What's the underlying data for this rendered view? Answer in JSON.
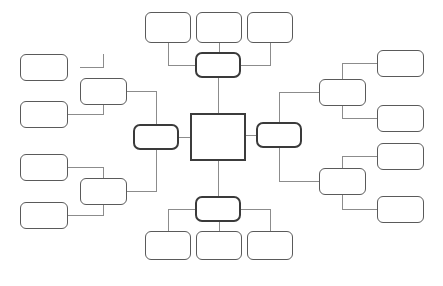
{
  "diagram": {
    "type": "concept-map",
    "title": "",
    "orientation": "radial",
    "style": {
      "background_color": "#ffffff",
      "node_fill": "#ffffff",
      "node_border_color": "#5a5a5a",
      "hub_border_color": "#3a3a3a",
      "center_border_color": "#3c3c3c",
      "connector_color": "#8c8c8c",
      "connector_width": 1
    },
    "center": {
      "id": "center",
      "label": "",
      "shape": "square",
      "x": 190,
      "y": 113,
      "w": 56,
      "h": 48
    },
    "hubs": [
      {
        "id": "hub-top",
        "label": "",
        "x": 195,
        "y": 52,
        "w": 46,
        "h": 26
      },
      {
        "id": "hub-bottom",
        "label": "",
        "x": 195,
        "y": 196,
        "w": 46,
        "h": 26
      },
      {
        "id": "hub-left",
        "label": "",
        "x": 133,
        "y": 124,
        "w": 46,
        "h": 26
      },
      {
        "id": "hub-right",
        "label": "",
        "x": 256,
        "y": 122,
        "w": 46,
        "h": 26
      }
    ],
    "branches": [
      {
        "id": "branch-left-upper",
        "label": "",
        "x": 80,
        "y": 78,
        "w": 47,
        "h": 27
      },
      {
        "id": "branch-left-lower",
        "label": "",
        "x": 80,
        "y": 178,
        "w": 47,
        "h": 27
      },
      {
        "id": "branch-right-upper",
        "label": "",
        "x": 319,
        "y": 79,
        "w": 47,
        "h": 27
      },
      {
        "id": "branch-right-lower",
        "label": "",
        "x": 319,
        "y": 168,
        "w": 47,
        "h": 27
      }
    ],
    "leaves": [
      {
        "id": "leaf-top-1",
        "label": "",
        "x": 145,
        "y": 12,
        "w": 46,
        "h": 31
      },
      {
        "id": "leaf-top-2",
        "label": "",
        "x": 196,
        "y": 12,
        "w": 46,
        "h": 31
      },
      {
        "id": "leaf-top-3",
        "label": "",
        "x": 247,
        "y": 12,
        "w": 46,
        "h": 31
      },
      {
        "id": "leaf-bottom-1",
        "label": "",
        "x": 145,
        "y": 231,
        "w": 46,
        "h": 29
      },
      {
        "id": "leaf-bottom-2",
        "label": "",
        "x": 196,
        "y": 231,
        "w": 46,
        "h": 29
      },
      {
        "id": "leaf-bottom-3",
        "label": "",
        "x": 247,
        "y": 231,
        "w": 46,
        "h": 29
      },
      {
        "id": "leaf-left-upper-1",
        "label": "",
        "x": 20,
        "y": 54,
        "w": 48,
        "h": 27
      },
      {
        "id": "leaf-left-upper-2",
        "label": "",
        "x": 20,
        "y": 101,
        "w": 48,
        "h": 27
      },
      {
        "id": "leaf-left-lower-1",
        "label": "",
        "x": 20,
        "y": 154,
        "w": 48,
        "h": 27
      },
      {
        "id": "leaf-left-lower-2",
        "label": "",
        "x": 20,
        "y": 202,
        "w": 48,
        "h": 27
      },
      {
        "id": "leaf-right-upper-1",
        "label": "",
        "x": 377,
        "y": 50,
        "w": 47,
        "h": 27
      },
      {
        "id": "leaf-right-upper-2",
        "label": "",
        "x": 377,
        "y": 105,
        "w": 47,
        "h": 27
      },
      {
        "id": "leaf-right-lower-1",
        "label": "",
        "x": 377,
        "y": 143,
        "w": 47,
        "h": 27
      },
      {
        "id": "leaf-right-lower-2",
        "label": "",
        "x": 377,
        "y": 196,
        "w": 47,
        "h": 27
      }
    ],
    "connectors": [
      {
        "from": "center",
        "to": "hub-top",
        "path": "M 218 113 L 218 78"
      },
      {
        "from": "center",
        "to": "hub-bottom",
        "path": "M 218 161 L 218 196"
      },
      {
        "from": "center",
        "to": "hub-left",
        "path": "M 190 137 L 179 137"
      },
      {
        "from": "center",
        "to": "hub-right",
        "path": "M 246 135 L 256 135"
      },
      {
        "from": "hub-top",
        "to": "leaf-top-1",
        "path": "M 195 65 L 168 65 L 168 43"
      },
      {
        "from": "hub-top",
        "to": "leaf-top-2",
        "path": "M 219 52 L 219 43"
      },
      {
        "from": "hub-top",
        "to": "leaf-top-3",
        "path": "M 241 65 L 270 65 L 270 43"
      },
      {
        "from": "hub-bottom",
        "to": "leaf-bottom-1",
        "path": "M 195 209 L 168 209 L 168 231"
      },
      {
        "from": "hub-bottom",
        "to": "leaf-bottom-2",
        "path": "M 219 222 L 219 231"
      },
      {
        "from": "hub-bottom",
        "to": "leaf-bottom-3",
        "path": "M 241 209 L 270 209 L 270 231"
      },
      {
        "from": "hub-left",
        "to": "branch-left-upper",
        "path": "M 156 124 L 156 91 L 127 91"
      },
      {
        "from": "hub-left",
        "to": "branch-left-lower",
        "path": "M 156 150 L 156 191 L 127 191"
      },
      {
        "from": "branch-left-upper",
        "to": "leaf-left-upper-1",
        "path": "M 80 67 L 103 67 L 103 54"
      },
      {
        "from": "branch-left-upper",
        "to": "leaf-left-upper-2",
        "path": "M 68 114 L 103 114 L 103 105"
      },
      {
        "from": "branch-left-lower",
        "to": "leaf-left-lower-1",
        "path": "M 68 167 L 103 167 L 103 178"
      },
      {
        "from": "branch-left-lower",
        "to": "leaf-left-lower-2",
        "path": "M 68 215 L 103 215 L 103 205"
      },
      {
        "from": "hub-right",
        "to": "branch-right-upper",
        "path": "M 279 122 L 279 92 L 319 92"
      },
      {
        "from": "hub-right",
        "to": "branch-right-lower",
        "path": "M 279 147 L 279 181 L 319 181"
      },
      {
        "from": "branch-right-upper",
        "to": "leaf-right-upper-1",
        "path": "M 342 79 L 342 63 L 377 63"
      },
      {
        "from": "branch-right-upper",
        "to": "leaf-right-upper-2",
        "path": "M 342 106 L 342 118 L 377 118"
      },
      {
        "from": "branch-right-lower",
        "to": "leaf-right-lower-1",
        "path": "M 342 168 L 342 156 L 377 156"
      },
      {
        "from": "branch-right-lower",
        "to": "leaf-right-lower-2",
        "path": "M 342 195 L 342 209 L 377 209"
      }
    ]
  }
}
